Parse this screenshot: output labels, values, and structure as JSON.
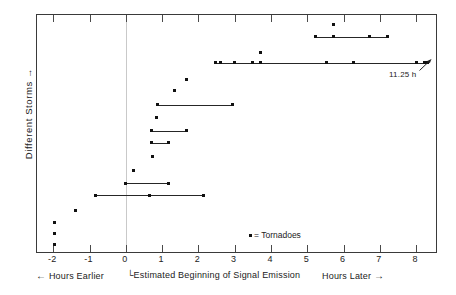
{
  "figure": {
    "ylabel": "Different Storms",
    "ylabel_arrow": "→",
    "legend": "= Tornadoes",
    "legend_marker": "square-marker",
    "annotation": "11.25 h",
    "caption_left": "Hours Earlier",
    "caption_left_arrow": "←",
    "caption_center": "Estimated Beginning of Signal Emission",
    "caption_right": "Hours Later",
    "caption_right_arrow": "→"
  },
  "chart_data": {
    "type": "scatter",
    "title": "",
    "xlabel": "Estimated Beginning of Signal Emission",
    "ylabel": "Different Storms",
    "xlim": [
      -2.45,
      8.6
    ],
    "ylim": [
      0,
      20
    ],
    "grid": false,
    "legend_position": "inside-bottom-center",
    "xticks": [
      -2,
      -1,
      0,
      1,
      2,
      3,
      4,
      5,
      6,
      7,
      8
    ],
    "xticklabels": [
      "-2",
      "-1",
      "0",
      "1",
      "2",
      "3",
      "4",
      "5",
      "6",
      "7",
      "8"
    ],
    "yticks": [],
    "yticklabels": [],
    "zero_reference_line": 0,
    "annotations": [
      {
        "text": "11.25 h",
        "x": 8.3,
        "y": 16,
        "note": "line extends to 11.25 h beyond axis"
      }
    ],
    "legend_entries": [
      {
        "label": "= Tornadoes",
        "marker": "square"
      }
    ],
    "series": [
      {
        "name": "storm-row-1",
        "row": 1,
        "y": 19.2,
        "segment": null,
        "points": [
          5.72
        ]
      },
      {
        "name": "storm-row-2",
        "row": 2,
        "y": 18.2,
        "segment": [
          5.22,
          7.22
        ],
        "points": [
          5.22,
          5.72,
          6.72,
          7.22
        ]
      },
      {
        "name": "storm-row-3",
        "row": 3,
        "y": 16.9,
        "segment": null,
        "points": [
          3.7
        ]
      },
      {
        "name": "storm-row-4",
        "row": 4,
        "y": 16.0,
        "segment": [
          2.48,
          8.3
        ],
        "points": [
          2.48,
          2.62,
          3.0,
          3.48,
          3.7,
          5.52,
          6.28,
          8.02,
          8.22,
          8.3
        ]
      },
      {
        "name": "storm-row-5",
        "row": 5,
        "y": 14.6,
        "segment": null,
        "points": [
          1.68
        ]
      },
      {
        "name": "storm-row-6",
        "row": 6,
        "y": 13.7,
        "segment": null,
        "points": [
          1.35
        ]
      },
      {
        "name": "storm-row-7",
        "row": 7,
        "y": 12.5,
        "segment": [
          0.88,
          2.95
        ],
        "points": [
          0.88,
          2.95
        ]
      },
      {
        "name": "storm-row-8",
        "row": 8,
        "y": 11.4,
        "segment": null,
        "points": [
          0.85
        ]
      },
      {
        "name": "storm-row-9",
        "row": 9,
        "y": 10.3,
        "segment": [
          0.7,
          1.68
        ],
        "points": [
          0.7,
          1.68
        ]
      },
      {
        "name": "storm-row-10",
        "row": 10,
        "y": 9.3,
        "segment": [
          0.7,
          1.18
        ],
        "points": [
          0.7,
          1.18
        ]
      },
      {
        "name": "storm-row-11",
        "row": 11,
        "y": 8.2,
        "segment": null,
        "points": [
          0.72
        ]
      },
      {
        "name": "storm-row-12",
        "row": 12,
        "y": 7.0,
        "segment": null,
        "points": [
          0.22
        ]
      },
      {
        "name": "storm-row-13",
        "row": 13,
        "y": 5.9,
        "segment": [
          0.0,
          1.17
        ],
        "points": [
          0.0,
          1.17
        ]
      },
      {
        "name": "storm-row-14",
        "row": 14,
        "y": 4.9,
        "segment": [
          -0.83,
          2.15
        ],
        "points": [
          -0.83,
          0.65,
          2.15
        ]
      },
      {
        "name": "storm-row-15",
        "row": 15,
        "y": 3.6,
        "segment": null,
        "points": [
          -1.38
        ]
      },
      {
        "name": "storm-row-16",
        "row": 16,
        "y": 2.6,
        "segment": null,
        "points": [
          -1.97
        ]
      },
      {
        "name": "storm-row-17",
        "row": 17,
        "y": 1.7,
        "segment": null,
        "points": [
          -1.97
        ]
      },
      {
        "name": "storm-row-18",
        "row": 18,
        "y": 0.8,
        "segment": null,
        "points": [
          -1.97
        ]
      }
    ]
  }
}
